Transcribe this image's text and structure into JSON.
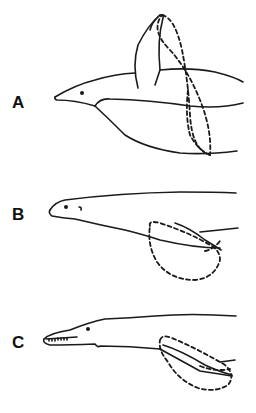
{
  "figure": {
    "panels": [
      {
        "id": "A",
        "label": "A",
        "description": "Penguin-like diver with wing raised; dashed ellipse shows wing stroke path"
      },
      {
        "id": "B",
        "label": "B",
        "description": "Seal-like diver with hind flipper; dashed loop shows flipper stroke path"
      },
      {
        "id": "C",
        "label": "C",
        "description": "Long-snouted reptile-like diver with toothed jaw; dashed loop shows flipper stroke path"
      }
    ],
    "colors": {
      "ink": "#1a1a1a",
      "background": "#ffffff"
    }
  }
}
